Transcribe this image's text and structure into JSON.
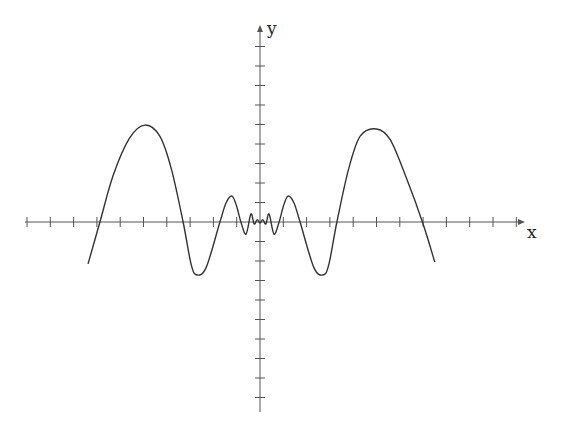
{
  "chart_data": {
    "type": "line",
    "title": "",
    "xlabel": "x",
    "ylabel": "y",
    "grid": false,
    "legend": null,
    "xlim": [
      -10,
      11.3
    ],
    "ylim": [
      -9.8,
      9.8
    ],
    "x_ticks_count_left": 10,
    "x_ticks_count_right": 11,
    "y_ticks_count_up": 9,
    "y_ticks_count_down": 9,
    "tick_labels_shown": false,
    "series": [
      {
        "name": "curve",
        "color": "#333333",
        "points": [
          [
            -7.38,
            -2.15
          ],
          [
            -6.87,
            0.0
          ],
          [
            -6.3,
            2.4
          ],
          [
            -5.6,
            4.3
          ],
          [
            -4.94,
            4.97
          ],
          [
            -4.3,
            4.4
          ],
          [
            -3.8,
            2.7
          ],
          [
            -3.3,
            0.0
          ],
          [
            -2.95,
            -2.2
          ],
          [
            -2.7,
            -2.72
          ],
          [
            -2.3,
            -2.3
          ],
          [
            -1.72,
            0.0
          ],
          [
            -1.45,
            1.0
          ],
          [
            -1.2,
            1.33
          ],
          [
            -1.0,
            0.8
          ],
          [
            -0.82,
            0.0
          ],
          [
            -0.6,
            -0.62
          ],
          [
            -0.39,
            0.41
          ],
          [
            -0.25,
            -0.1
          ],
          [
            -0.12,
            0.12
          ],
          [
            0.0,
            -0.05
          ],
          [
            0.12,
            0.12
          ],
          [
            0.25,
            -0.1
          ],
          [
            0.39,
            0.41
          ],
          [
            0.6,
            -0.62
          ],
          [
            0.82,
            0.0
          ],
          [
            1.0,
            0.8
          ],
          [
            1.2,
            1.33
          ],
          [
            1.45,
            1.0
          ],
          [
            1.72,
            0.0
          ],
          [
            2.3,
            -2.3
          ],
          [
            2.7,
            -2.72
          ],
          [
            2.95,
            -2.2
          ],
          [
            3.3,
            0.0
          ],
          [
            3.8,
            2.7
          ],
          [
            4.3,
            4.4
          ],
          [
            5.0,
            4.77
          ],
          [
            5.6,
            4.2
          ],
          [
            6.3,
            2.2
          ],
          [
            7.0,
            -0.1
          ],
          [
            7.5,
            -2.05
          ]
        ]
      }
    ],
    "annotations": []
  },
  "labels": {
    "x": "x",
    "y": "y"
  },
  "colors": {
    "axis": "#555555",
    "curve": "#333333",
    "background": "#ffffff"
  }
}
